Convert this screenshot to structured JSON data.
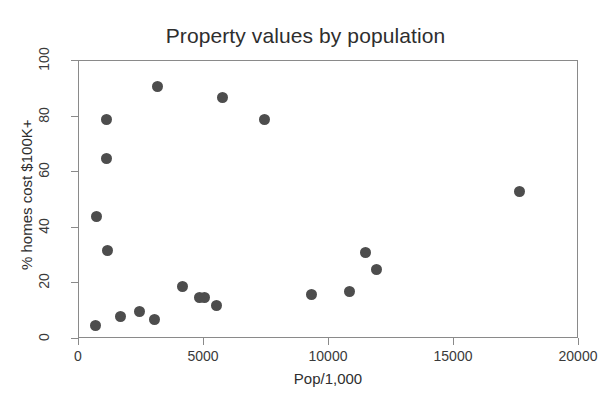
{
  "chart_data": {
    "type": "scatter",
    "title": "Property values by population",
    "xlabel": "Pop/1,000",
    "ylabel": "% homes cost $100K+",
    "xlim": [
      0,
      20000
    ],
    "ylim": [
      0,
      100
    ],
    "xticks": [
      0,
      5000,
      10000,
      15000,
      20000
    ],
    "xtick_labels": [
      "0",
      "5000",
      "10000",
      "15000",
      "20000"
    ],
    "yticks": [
      0,
      20,
      40,
      60,
      80,
      100
    ],
    "ytick_labels": [
      "0",
      "20",
      "40",
      "60",
      "80",
      "100"
    ],
    "grid": false,
    "legend": null,
    "marker": {
      "shape": "circle",
      "color": "#4d4d4d",
      "size_px": 11
    },
    "series": [
      {
        "name": "cities",
        "points": [
          {
            "x": 650,
            "y": 5
          },
          {
            "x": 700,
            "y": 44
          },
          {
            "x": 1100,
            "y": 79
          },
          {
            "x": 1100,
            "y": 65
          },
          {
            "x": 1150,
            "y": 32
          },
          {
            "x": 1650,
            "y": 8
          },
          {
            "x": 2400,
            "y": 10
          },
          {
            "x": 3000,
            "y": 7
          },
          {
            "x": 3150,
            "y": 91
          },
          {
            "x": 4150,
            "y": 19
          },
          {
            "x": 4800,
            "y": 15
          },
          {
            "x": 5000,
            "y": 15
          },
          {
            "x": 5500,
            "y": 12
          },
          {
            "x": 5750,
            "y": 87
          },
          {
            "x": 7400,
            "y": 79
          },
          {
            "x": 9300,
            "y": 16
          },
          {
            "x": 10800,
            "y": 17
          },
          {
            "x": 11450,
            "y": 31
          },
          {
            "x": 11900,
            "y": 25
          },
          {
            "x": 17600,
            "y": 53
          }
        ]
      }
    ]
  },
  "colors": {
    "background": "#ffffff",
    "marker": "#4d4d4d",
    "axis": "#8a8a8a",
    "text": "#2e2e2e"
  }
}
